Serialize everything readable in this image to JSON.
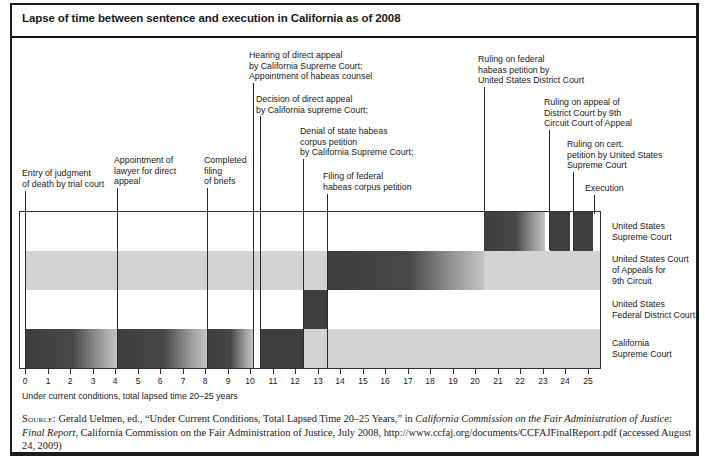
{
  "title": "Lapse of time between sentence and execution in California as of 2008",
  "colors": {
    "bar_dark": "#3e3e3e",
    "bar_fade_end": "#c4c4c4",
    "band_gray": "#d3d3d3",
    "border": "#1c1c1c"
  },
  "chart_data": {
    "type": "gantt-timeline",
    "title": "Lapse of time between sentence and execution in California as of 2008",
    "note": "Under current conditions, total lapsed time 20–25 years",
    "x_axis": {
      "min": 0,
      "max": 25,
      "tick_interval": 1,
      "unit": "years"
    },
    "rows": [
      {
        "label_lines": [
          "United States",
          "Supreme Court"
        ],
        "band": null,
        "bars": [
          {
            "from": 20.4,
            "to": 23.1,
            "style": "fade"
          },
          {
            "from": 23.35,
            "to": 24.2,
            "style": "solid"
          },
          {
            "from": 24.35,
            "to": 25.25,
            "style": "solid"
          }
        ]
      },
      {
        "label_lines": [
          "United States Court",
          "of Appeals for",
          "9th Circuit"
        ],
        "band": {
          "from": 0,
          "to": 25.55
        },
        "bars": [
          {
            "from": 13.4,
            "to": 20.4,
            "style": "fade"
          }
        ]
      },
      {
        "label_lines": [
          "United States",
          "Federal District Court"
        ],
        "band": null,
        "bars": [
          {
            "from": 12.35,
            "to": 13.4,
            "style": "solid"
          }
        ]
      },
      {
        "label_lines": [
          "California",
          "Supreme Court"
        ],
        "band": {
          "from": 12.35,
          "to": 25.55
        },
        "bars": [
          {
            "from": 0,
            "to": 4.1,
            "style": "fade"
          },
          {
            "from": 4.1,
            "to": 8.1,
            "style": "fade"
          },
          {
            "from": 8.1,
            "to": 10.15,
            "style": "fade"
          },
          {
            "from": 10.45,
            "to": 12.35,
            "style": "solid"
          }
        ]
      }
    ],
    "events": [
      {
        "label_lines": [
          "Entry of judgment",
          "of death by trial court"
        ],
        "x": 0,
        "text_x": 22,
        "text_y": 168,
        "leader_top": 191,
        "leader_bottom": 369
      },
      {
        "label_lines": [
          "Appointment of",
          "lawyer for direct",
          "appeal"
        ],
        "x": 4.1,
        "text_x": 114,
        "text_y": 155,
        "leader_top": 188,
        "leader_bottom": 369
      },
      {
        "label_lines": [
          "Completed",
          "filing",
          "of briefs"
        ],
        "x": 8.1,
        "text_x": 204,
        "text_y": 155,
        "leader_top": 188,
        "leader_bottom": 369
      },
      {
        "label_lines": [
          "Hearing of direct appeal",
          "by California Supreme Court;",
          "Appointment of habeas counsel"
        ],
        "x": 10.15,
        "text_x": 249,
        "text_y": 50,
        "leader_top": 83,
        "leader_bottom": 369
      },
      {
        "label_lines": [
          "Decision of direct appeal",
          "by California supreme Court;"
        ],
        "x": 10.45,
        "text_x": 256,
        "text_y": 94,
        "leader_top": 116,
        "leader_bottom": 369
      },
      {
        "label_lines": [
          "Denial of state habeas",
          "corpus petition",
          "by California Supreme Court;"
        ],
        "x": 12.35,
        "text_x": 300,
        "text_y": 126,
        "leader_top": 159,
        "leader_bottom": 369
      },
      {
        "label_lines": [
          "Filing of federal",
          "habeas corpus petition"
        ],
        "x": 13.4,
        "text_x": 323,
        "text_y": 171,
        "leader_top": 194,
        "leader_bottom": 369
      },
      {
        "label_lines": [
          "Ruling on federal",
          "habeas petition by",
          "United States District Court"
        ],
        "x": 20.4,
        "text_x": 478,
        "text_y": 54,
        "leader_top": 87,
        "leader_bottom": 214
      },
      {
        "label_lines": [
          "Ruling on appeal of",
          "District Court by 9th",
          "Circuit Court of Appeal"
        ],
        "x": 23.3,
        "text_x": 544,
        "text_y": 97,
        "leader_top": 130,
        "leader_bottom": 250
      },
      {
        "label_lines": [
          "Ruling on cert.",
          "petition by United States",
          "Supreme Court"
        ],
        "x": 24.35,
        "text_x": 567,
        "text_y": 139,
        "leader_top": 172,
        "leader_bottom": 250
      },
      {
        "label_lines": [
          "Execution"
        ],
        "x": 25.3,
        "text_x": 585,
        "text_y": 183,
        "leader_top": 195,
        "leader_bottom": 214
      }
    ],
    "layout_px": {
      "origin_x": 25,
      "unit": 22.5,
      "plot_left": 19,
      "plot_right": 600,
      "plot_top": 212,
      "row_h": 39,
      "axis_y": 368,
      "label_x": 612
    }
  },
  "source": {
    "label": "Source:",
    "parts": [
      {
        "text": " Gerald Uelmen, ed., “Under Current Conditions, Total Lapsed Time 20–25 Years,” in ",
        "italic": false
      },
      {
        "text": "California Commission on the Fair Administration of Justice: Final Report",
        "italic": true
      },
      {
        "text": ", California Commission on the Fair Administration of Justice, July 2008, http://www.ccfaj.org/documents/CCFAJFinalReport.pdf (accessed August 24, 2009)",
        "italic": false
      }
    ]
  }
}
